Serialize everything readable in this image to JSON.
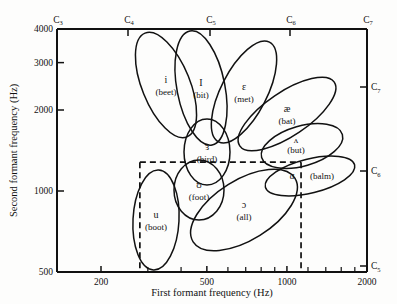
{
  "chart_data": {
    "type": "scatter",
    "title": "",
    "xlabel": "First formant frequency (Hz)",
    "ylabel": "Second formant frequency (Hz)",
    "xscale": "log",
    "yscale": "log",
    "xlim": [
      150,
      2000
    ],
    "ylim": [
      500,
      4000
    ],
    "grid": false,
    "legend": "none",
    "xticks_labeled": [
      "200",
      "500",
      "1000",
      "2000"
    ],
    "xticks_labeled_values": [
      200,
      500,
      1000,
      2000
    ],
    "xticks_minor_values": [
      300,
      400,
      600,
      700,
      800,
      900,
      1200,
      1400,
      1600,
      1800
    ],
    "yticks_labeled": [
      "4000",
      "3000",
      "2000",
      "1000",
      "500"
    ],
    "yticks_labeled_values": [
      4000,
      3000,
      2000,
      1000,
      500
    ],
    "top_axis_label": "",
    "top_axis_ticks": [
      "C3",
      "C4",
      "C5",
      "C6",
      "C7"
    ],
    "top_axis_tick_text": [
      "C",
      "C",
      "C",
      "C",
      "C"
    ],
    "top_axis_tick_sub": [
      "3",
      "4",
      "5",
      "6",
      "7"
    ],
    "top_axis_tick_x": [
      57,
      128,
      210,
      290,
      367
    ],
    "right_axis_ticks": [
      "C7",
      "C6",
      "C5"
    ],
    "right_axis_tick_text": [
      "C",
      "C",
      "C"
    ],
    "right_axis_tick_sub": [
      "7",
      "6",
      "5"
    ],
    "right_axis_tick_y": [
      87,
      171,
      266
    ],
    "reference_box": {
      "label": "dashed-reference-rectangle",
      "x1_hz": 280,
      "x2_hz": 1130,
      "y1_hz": 1280,
      "y2_hz": 500
    },
    "annotations": [
      {
        "id": "i",
        "symbol": "i",
        "word": "(beet)",
        "f1_hz": 310,
        "f2_hz": 2790,
        "cx": 166,
        "cy": 85,
        "rx": 24,
        "ry": 56,
        "rot": -22
      },
      {
        "id": "I",
        "symbol": "I",
        "word": "(bit)",
        "f1_hz": 400,
        "f2_hz": 2480,
        "cx": 201,
        "cy": 88,
        "rx": 24,
        "ry": 58,
        "rot": -11
      },
      {
        "id": "E",
        "symbol": "ɛ",
        "word": "(met)",
        "f1_hz": 560,
        "f2_hz": 2300,
        "cx": 244,
        "cy": 92,
        "rx": 23,
        "ry": 56,
        "rot": 27
      },
      {
        "id": "ae",
        "symbol": "æ",
        "word": "(bat)",
        "f1_hz": 700,
        "f2_hz": 2080,
        "cx": 287,
        "cy": 114,
        "rx": 22,
        "ry": 57,
        "rot": 56
      },
      {
        "id": "er",
        "symbol": "ɜ",
        "word": "(bird)",
        "f1_hz": 480,
        "f2_hz": 1460,
        "cx": 207,
        "cy": 152,
        "rx": 23,
        "ry": 33,
        "rot": 0
      },
      {
        "id": "uh",
        "symbol": "ʌ",
        "word": "(but)",
        "f1_hz": 800,
        "f2_hz": 1330,
        "cx": 302,
        "cy": 146,
        "rx": 42,
        "ry": 20,
        "rot": -16
      },
      {
        "id": "a",
        "symbol": "ɑ",
        "word": "(balm)",
        "f1_hz": 900,
        "f2_hz": 1180,
        "cx": 310,
        "cy": 176,
        "rx": 46,
        "ry": 17,
        "rot": -14
      },
      {
        "id": "U",
        "symbol": "ʊ",
        "word": "(foot)",
        "f1_hz": 450,
        "f2_hz": 1080,
        "cx": 199,
        "cy": 190,
        "rx": 25,
        "ry": 30,
        "rot": 0
      },
      {
        "id": "aw",
        "symbol": "ɔ",
        "word": "(all)",
        "f1_hz": 620,
        "f2_hz": 880,
        "cx": 244,
        "cy": 210,
        "rx": 30,
        "ry": 60,
        "rot": 58
      },
      {
        "id": "u",
        "symbol": "u",
        "word": "(boot)",
        "f1_hz": 320,
        "f2_hz": 790,
        "cx": 156,
        "cy": 220,
        "rx": 23,
        "ry": 50,
        "rot": 3
      }
    ],
    "series": [
      {
        "name": "vowel-centroids",
        "x": [
          310,
          400,
          560,
          700,
          480,
          800,
          900,
          450,
          620,
          320
        ],
        "y": [
          2790,
          2480,
          2300,
          2080,
          1460,
          1330,
          1180,
          1080,
          880,
          790
        ],
        "labels": [
          "i",
          "I",
          "ɛ",
          "æ",
          "ɜ",
          "ʌ",
          "ɑ",
          "ʊ",
          "ɔ",
          "u"
        ],
        "words": [
          "(beet)",
          "(bit)",
          "(met)",
          "(bat)",
          "(bird)",
          "(but)",
          "(balm)",
          "(foot)",
          "(all)",
          "(boot)"
        ]
      }
    ]
  },
  "axes": {
    "xlabel": "First formant frequency (Hz)",
    "ylabel": "Second formant frequency (Hz)"
  }
}
